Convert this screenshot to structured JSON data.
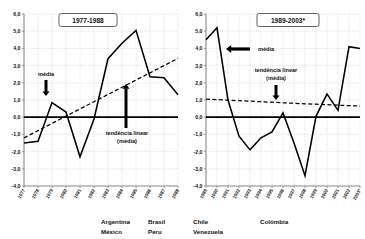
{
  "figure": {
    "background": "#ffffff",
    "line_color": "#000000",
    "grid_color": "#b9b9b9"
  },
  "legend": {
    "row1": [
      "Argentina",
      "Brasil",
      "Chile",
      "Colômbia"
    ],
    "row2": [
      "México",
      "Peru",
      "Venezuela"
    ]
  },
  "annotations": {
    "media": "média",
    "trend_line1": "tendência linear",
    "trend_line2": "(média)"
  },
  "chart_data": [
    {
      "type": "line",
      "title": "1977-1988",
      "xlabel": "",
      "ylabel": "",
      "ylim": [
        -4.0,
        6.0
      ],
      "yticks": [
        "-4,0",
        "-3,0",
        "-2,0",
        "-1,0",
        "0,0",
        "1,0",
        "2,0",
        "3,0",
        "4,0",
        "5,0",
        "6,0"
      ],
      "ytick_values": [
        -4,
        -3,
        -2,
        -1,
        0,
        1,
        2,
        3,
        4,
        5,
        6
      ],
      "grid": true,
      "legend_position": "none",
      "categories": [
        "1977",
        "1978",
        "1979",
        "1980",
        "1981",
        "1982",
        "1983",
        "1984",
        "1985",
        "1986",
        "1987",
        "1988"
      ],
      "series": [
        {
          "name": "média",
          "style": "solid",
          "values": [
            -1.5,
            -1.4,
            0.85,
            0.3,
            -2.3,
            -0.1,
            3.4,
            4.3,
            5.05,
            2.35,
            2.3,
            1.3
          ]
        },
        {
          "name": "tendência linear (média)",
          "style": "dashed",
          "values": [
            -1.2,
            -0.78,
            -0.36,
            0.06,
            0.48,
            0.9,
            1.32,
            1.74,
            2.16,
            2.58,
            3.0,
            3.42
          ]
        }
      ],
      "annotations": [
        {
          "label": "média",
          "arrow": "down",
          "at_category": "1979"
        },
        {
          "label": "tendência linear (média)",
          "arrow": "up",
          "at_category": "1984"
        }
      ]
    },
    {
      "type": "line",
      "title": "1989-2003*",
      "xlabel": "",
      "ylabel": "",
      "ylim": [
        -4.0,
        6.0
      ],
      "yticks": [
        "-4,0",
        "-3,0",
        "-2,0",
        "-1,0",
        "0,0",
        "1,0",
        "2,0",
        "3,0",
        "4,0",
        "5,0",
        "6,0"
      ],
      "ytick_values": [
        -4,
        -3,
        -2,
        -1,
        0,
        1,
        2,
        3,
        4,
        5,
        6
      ],
      "grid": true,
      "legend_position": "none",
      "categories": [
        "1989",
        "1990",
        "1991",
        "1992",
        "1993",
        "1994",
        "1995",
        "1996",
        "1997",
        "1998",
        "1999",
        "2000",
        "2001",
        "2002",
        "2003*"
      ],
      "series": [
        {
          "name": "média",
          "style": "solid",
          "values": [
            4.5,
            5.2,
            1.0,
            -1.1,
            -1.9,
            -1.2,
            -0.85,
            0.25,
            -1.5,
            -3.4,
            0.05,
            1.35,
            0.4,
            4.1,
            4.0
          ]
        },
        {
          "name": "tendência linear (média)",
          "style": "dashed",
          "values": [
            1.05,
            1.02,
            0.99,
            0.96,
            0.93,
            0.9,
            0.87,
            0.84,
            0.81,
            0.78,
            0.76,
            0.73,
            0.7,
            0.67,
            0.65
          ]
        }
      ],
      "annotations": [
        {
          "label": "média",
          "arrow": "left",
          "at_category": "1992"
        },
        {
          "label": "tendência linear (média)",
          "arrow": "down",
          "at_category": "1997"
        }
      ]
    }
  ]
}
